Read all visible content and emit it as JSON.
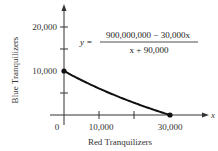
{
  "chart_data": {
    "type": "line",
    "title": "",
    "xlabel": "Red Tranquilizers",
    "ylabel": "Blue Tranquilizers",
    "x_axis_var": "x",
    "annotation": {
      "lhs": "y =",
      "numerator": "900,000,000 − 30,000x",
      "denominator": "x + 90,000"
    },
    "x_ticks": [
      "0",
      "10,000",
      "30,000"
    ],
    "x_tick_values": [
      0,
      10000,
      20000,
      30000
    ],
    "y_ticks": [
      "10,000",
      "20,000"
    ],
    "y_tick_values": [
      10000,
      15000,
      20000
    ],
    "xlim": [
      0,
      40000
    ],
    "ylim": [
      0,
      25000
    ],
    "grid": false,
    "series": [
      {
        "name": "y = (900,000,000 - 30,000x)/(x + 90,000)",
        "x": [
          0,
          5000,
          10000,
          15000,
          20000,
          25000,
          30000
        ],
        "y": [
          10000,
          7895,
          6000,
          4286,
          2727,
          1304,
          0
        ]
      }
    ],
    "marked_points": [
      {
        "x": 0,
        "y": 10000
      },
      {
        "x": 30000,
        "y": 0
      }
    ]
  }
}
